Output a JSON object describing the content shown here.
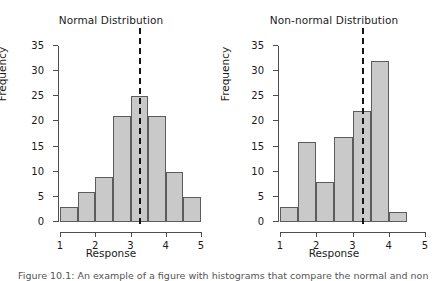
{
  "figure": {
    "caption": "Figure 10.1: An example of a figure with histograms that compare the normal and non-normal distributions.",
    "bar_fill": "#c9c9c9",
    "bar_border": "#5c5c5c",
    "axis_color": "#4d4d4d",
    "vline_color": "#141414"
  },
  "chart_data": [
    {
      "type": "bar",
      "title": "Normal Distribution",
      "xlabel": "Response",
      "ylabel": "Frequency",
      "categories": [
        "1.0-1.5",
        "1.5-2.0",
        "2.0-2.5",
        "2.5-3.0",
        "3.0-3.5",
        "3.5-4.0",
        "4.0-4.5",
        "4.5-5.0"
      ],
      "bin_edges": [
        1,
        1.5,
        2,
        2.5,
        3,
        3.5,
        4,
        4.5,
        5
      ],
      "values": [
        3,
        6,
        9,
        21,
        25,
        21,
        10,
        5
      ],
      "xlim": [
        1,
        5
      ],
      "ylim": [
        0,
        35
      ],
      "xticks": [
        "1",
        "2",
        "3",
        "4",
        "5"
      ],
      "xtick_values": [
        1,
        2,
        3,
        4,
        5
      ],
      "yticks": [
        "0",
        "5",
        "10",
        "15",
        "20",
        "25",
        "30",
        "35"
      ],
      "ytick_values": [
        0,
        5,
        10,
        15,
        20,
        25,
        30,
        35
      ],
      "grid": false,
      "legend": "none",
      "annotations": [
        {
          "kind": "vertical-dashed-line",
          "label": "mean",
          "x": 3.25
        }
      ]
    },
    {
      "type": "bar",
      "title": "Non-normal Distribution",
      "xlabel": "Response",
      "ylabel": "Frequency",
      "categories": [
        "1.0-1.5",
        "1.5-2.0",
        "2.0-2.5",
        "2.5-3.0",
        "3.0-3.5",
        "3.5-4.0",
        "4.0-4.5"
      ],
      "bin_edges": [
        1,
        1.5,
        2,
        2.5,
        3,
        3.5,
        4,
        4.5
      ],
      "values": [
        3,
        16,
        8,
        17,
        22,
        32,
        2
      ],
      "xlim": [
        1,
        5
      ],
      "ylim": [
        0,
        35
      ],
      "xticks": [
        "1",
        "2",
        "3",
        "4",
        "5"
      ],
      "xtick_values": [
        1,
        2,
        3,
        4,
        5
      ],
      "yticks": [
        "0",
        "5",
        "10",
        "15",
        "20",
        "25",
        "30",
        "35"
      ],
      "ytick_values": [
        0,
        5,
        10,
        15,
        20,
        25,
        30,
        35
      ],
      "grid": false,
      "legend": "none",
      "annotations": [
        {
          "kind": "vertical-dashed-line",
          "label": "mean",
          "x": 3.25
        }
      ]
    }
  ]
}
